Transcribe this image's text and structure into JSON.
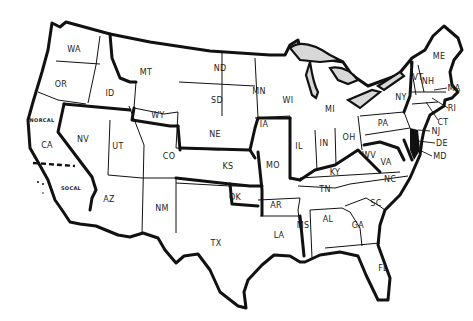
{
  "map": {
    "title": "United States",
    "colors": {
      "outline": "#111111",
      "fill": "#ffffff",
      "lakes": "#d8d8d8"
    },
    "labels": [
      {
        "id": "wa",
        "text": "WA",
        "x": 74,
        "y": 49
      },
      {
        "id": "or",
        "text": "OR",
        "x": 61,
        "y": 84
      },
      {
        "id": "id",
        "text": "ID",
        "x": 110,
        "y": 93
      },
      {
        "id": "mt",
        "text": "MT",
        "x": 146,
        "y": 72
      },
      {
        "id": "wy",
        "text": "WY",
        "x": 158,
        "y": 115
      },
      {
        "id": "nd",
        "text": "ND",
        "x": 220,
        "y": 68
      },
      {
        "id": "sd",
        "text": "SD",
        "x": 217,
        "y": 100
      },
      {
        "id": "mn",
        "text": "MN",
        "x": 259,
        "y": 91
      },
      {
        "id": "wi",
        "text": "WI",
        "x": 288,
        "y": 100
      },
      {
        "id": "mi",
        "text": "MI",
        "x": 330,
        "y": 109
      },
      {
        "id": "ia",
        "text": "IA",
        "x": 264,
        "y": 124
      },
      {
        "id": "ne",
        "text": "NE",
        "x": 215,
        "y": 134
      },
      {
        "id": "norcal",
        "text": "NORCAL",
        "x": 42,
        "y": 120,
        "small": true
      },
      {
        "id": "ca",
        "text": "CA",
        "x": 47,
        "y": 145
      },
      {
        "id": "nv",
        "text": "NV",
        "x": 83,
        "y": 139
      },
      {
        "id": "ut",
        "text": "UT",
        "x": 118,
        "y": 146
      },
      {
        "id": "co",
        "text": "CO",
        "x": 169,
        "y": 156
      },
      {
        "id": "ks",
        "text": "KS",
        "x": 228,
        "y": 166
      },
      {
        "id": "mo",
        "text": "MO",
        "x": 273,
        "y": 165
      },
      {
        "id": "il",
        "text": "IL",
        "x": 299,
        "y": 146
      },
      {
        "id": "in",
        "text": "IN",
        "x": 324,
        "y": 143
      },
      {
        "id": "oh",
        "text": "OH",
        "x": 349,
        "y": 137
      },
      {
        "id": "pa",
        "text": "PA",
        "x": 383,
        "y": 123
      },
      {
        "id": "ny",
        "text": "NY",
        "x": 401,
        "y": 97
      },
      {
        "id": "wv",
        "text": "WV",
        "x": 369,
        "y": 155
      },
      {
        "id": "va",
        "text": "VA",
        "x": 386,
        "y": 162
      },
      {
        "id": "ky",
        "text": "KY",
        "x": 335,
        "y": 172
      },
      {
        "id": "socal",
        "text": "SOCAL",
        "x": 71,
        "y": 188,
        "small": true
      },
      {
        "id": "az",
        "text": "AZ",
        "x": 109,
        "y": 199
      },
      {
        "id": "nm",
        "text": "NM",
        "x": 162,
        "y": 208
      },
      {
        "id": "ok",
        "text": "OK",
        "x": 235,
        "y": 197
      },
      {
        "id": "tx",
        "text": "TX",
        "x": 216,
        "y": 243
      },
      {
        "id": "ar",
        "text": "AR",
        "x": 276,
        "y": 205
      },
      {
        "id": "tn",
        "text": "TN",
        "x": 325,
        "y": 189
      },
      {
        "id": "nc",
        "text": "NC",
        "x": 390,
        "y": 179
      },
      {
        "id": "sc",
        "text": "SC",
        "x": 376,
        "y": 203
      },
      {
        "id": "ms",
        "text": "MS",
        "x": 303,
        "y": 225
      },
      {
        "id": "al",
        "text": "AL",
        "x": 328,
        "y": 219
      },
      {
        "id": "ga",
        "text": "GA",
        "x": 358,
        "y": 225
      },
      {
        "id": "la",
        "text": "LA",
        "x": 279,
        "y": 235
      },
      {
        "id": "fl",
        "text": "FL",
        "x": 383,
        "y": 268
      },
      {
        "id": "me",
        "text": "ME",
        "x": 439,
        "y": 56
      },
      {
        "id": "vt",
        "text": "VT",
        "x": 418,
        "y": 77
      },
      {
        "id": "nh",
        "text": "NH",
        "x": 428,
        "y": 81
      },
      {
        "id": "ma",
        "text": "MA",
        "x": 454,
        "y": 88
      },
      {
        "id": "ri",
        "text": "RI",
        "x": 452,
        "y": 108
      },
      {
        "id": "ct",
        "text": "CT",
        "x": 443,
        "y": 122
      },
      {
        "id": "nj",
        "text": "NJ",
        "x": 436,
        "y": 131
      },
      {
        "id": "de",
        "text": "DE",
        "x": 442,
        "y": 143
      },
      {
        "id": "md",
        "text": "MD",
        "x": 440,
        "y": 156
      }
    ]
  }
}
